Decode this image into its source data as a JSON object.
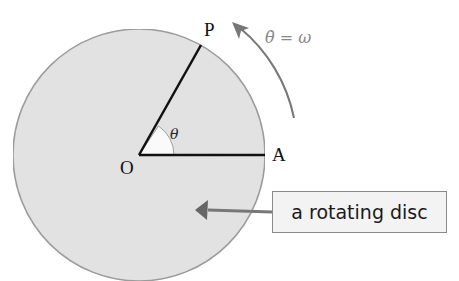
{
  "diagram": {
    "points": {
      "P": "P",
      "O": "O",
      "A": "A"
    },
    "angle_label": "θ",
    "angular_velocity_label": "θ̇ = ω",
    "callout_text": "a rotating disc",
    "colors": {
      "disc_fill": "#e4e4e4",
      "disc_edge": "#9a9a9a",
      "lines": "#111111",
      "arrow": "#777777",
      "angle_wedge": "#fafafa"
    }
  }
}
